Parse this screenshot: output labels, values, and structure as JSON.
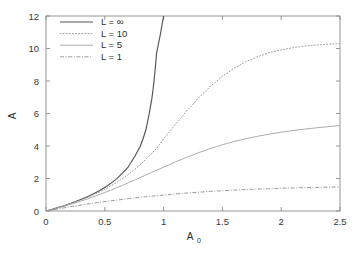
{
  "chart_data": {
    "type": "line",
    "title": "",
    "xlabel": "A_0",
    "xlabel_base": "A",
    "xlabel_sub": "0",
    "ylabel": "A",
    "xlim": [
      0,
      2.5
    ],
    "ylim": [
      0,
      12
    ],
    "xticks": [
      0,
      0.5,
      1,
      1.5,
      2,
      2.5
    ],
    "xticklabels": [
      "0",
      "0.5",
      "1",
      "1.5",
      "2",
      "2.5"
    ],
    "yticks": [
      0,
      2,
      4,
      6,
      8,
      10,
      12
    ],
    "yticklabels": [
      "0",
      "2",
      "4",
      "6",
      "8",
      "10",
      "12"
    ],
    "grid": false,
    "legend_position": "top-left",
    "x": [
      0,
      0.1,
      0.2,
      0.3,
      0.4,
      0.5,
      0.6,
      0.7,
      0.8,
      0.85,
      0.9,
      0.92,
      0.94,
      1.0,
      1.1,
      1.2,
      1.3,
      1.4,
      1.5,
      1.6,
      1.7,
      1.8,
      1.9,
      2.0,
      2.1,
      2.2,
      2.3,
      2.4,
      2.5
    ],
    "series": [
      {
        "name": "L = ∞",
        "label_base": "L = ",
        "label_value": "∞",
        "linestyle": "solid",
        "color": "#555555",
        "values": [
          0,
          0.21,
          0.45,
          0.72,
          1.05,
          1.45,
          1.98,
          2.72,
          3.95,
          5.0,
          6.9,
          8.1,
          9.7,
          12.0,
          null,
          null,
          null,
          null,
          null,
          null,
          null,
          null,
          null,
          null,
          null,
          null,
          null,
          null,
          null
        ]
      },
      {
        "name": "L = 10",
        "label_base": "L = ",
        "label_value": "10",
        "linestyle": "dotted",
        "color": "#9a9a9a",
        "values": [
          0,
          0.2,
          0.43,
          0.69,
          0.99,
          1.34,
          1.76,
          2.26,
          2.85,
          3.2,
          3.55,
          3.7,
          3.85,
          4.45,
          5.35,
          6.2,
          7.0,
          7.7,
          8.3,
          8.8,
          9.2,
          9.5,
          9.75,
          9.92,
          10.05,
          10.15,
          10.22,
          10.27,
          10.3
        ]
      },
      {
        "name": "L = 5",
        "label_base": "L = ",
        "label_value": "5",
        "linestyle": "solid",
        "color": "#a7a7a7",
        "values": [
          0,
          0.19,
          0.4,
          0.62,
          0.87,
          1.14,
          1.43,
          1.74,
          2.06,
          2.22,
          2.38,
          2.45,
          2.51,
          2.7,
          3.02,
          3.32,
          3.6,
          3.85,
          4.08,
          4.28,
          4.45,
          4.6,
          4.73,
          4.85,
          4.95,
          5.04,
          5.12,
          5.19,
          5.26
        ]
      },
      {
        "name": "L = 1",
        "label_base": "L = ",
        "label_value": "1",
        "linestyle": "dashdot",
        "color": "#8f8f8f",
        "values": [
          0,
          0.13,
          0.26,
          0.37,
          0.48,
          0.58,
          0.67,
          0.76,
          0.84,
          0.88,
          0.91,
          0.93,
          0.94,
          0.98,
          1.05,
          1.11,
          1.16,
          1.21,
          1.25,
          1.29,
          1.32,
          1.35,
          1.37,
          1.4,
          1.42,
          1.44,
          1.45,
          1.47,
          1.48
        ]
      }
    ]
  }
}
